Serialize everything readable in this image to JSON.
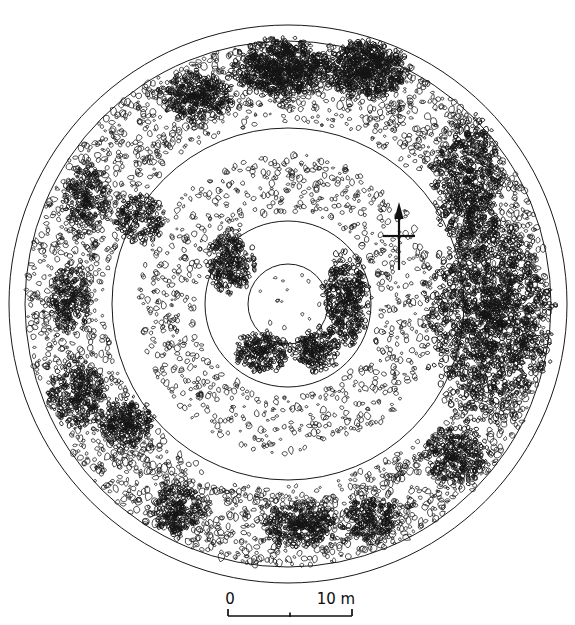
{
  "figure": {
    "kind": "archaeological-site-plan",
    "background_color": "#ffffff",
    "line_color": "#1a1a1a",
    "stone_color": "#141414"
  },
  "canvas": {
    "width": 575,
    "height": 625,
    "center_x": 288,
    "center_y": 304
  },
  "rings": [
    {
      "name": "outer-bank-outer-edge",
      "radius": 279
    },
    {
      "name": "outer-bank-inner-edge",
      "radius": 263
    },
    {
      "name": "middle-ring",
      "radius": 176
    },
    {
      "name": "inner-ring",
      "radius": 83
    },
    {
      "name": "central-circle",
      "radius": 40
    }
  ],
  "scale_bar": {
    "name": "scale-bar",
    "left_label": "0",
    "right_label": "10 m",
    "left_x": 228,
    "right_x": 352,
    "baseline_y": 616,
    "tick_height": 7,
    "mid_tick": true,
    "units": "m",
    "length_value": 10
  },
  "north_arrow": {
    "name": "north-arrow",
    "x": 399,
    "top_y": 202,
    "bottom_y": 270,
    "cross_y": 236,
    "cross_half_width": 16,
    "points": "up"
  },
  "stone_zones": [
    {
      "id": "outer-band-primary",
      "r_min": 196,
      "r_max": 262,
      "count": 2600,
      "size_min": 1.6,
      "size_max": 4.2,
      "seed": 11
    },
    {
      "id": "outer-band-secondary",
      "r_min": 182,
      "r_max": 205,
      "count": 520,
      "size_min": 1.5,
      "size_max": 3.4,
      "seed": 23
    },
    {
      "id": "mid-band",
      "r_min": 92,
      "r_max": 150,
      "count": 900,
      "size_min": 1.5,
      "size_max": 3.6,
      "seed": 37
    },
    {
      "id": "central-sparse",
      "r_min": 6,
      "r_max": 34,
      "count": 14,
      "size_min": 1.3,
      "size_max": 2.4,
      "seed": 53
    }
  ],
  "dense_clusters": [
    {
      "id": "east-massive",
      "cx": 489,
      "cy": 318,
      "rx": 56,
      "ry": 96,
      "count": 1500,
      "size": 2.7,
      "seed": 101
    },
    {
      "id": "east-upper",
      "cx": 470,
      "cy": 185,
      "rx": 34,
      "ry": 60,
      "count": 620,
      "size": 2.5,
      "seed": 107
    },
    {
      "id": "north-main",
      "cx": 281,
      "cy": 68,
      "rx": 44,
      "ry": 27,
      "count": 680,
      "size": 2.6,
      "seed": 113
    },
    {
      "id": "north-east",
      "cx": 366,
      "cy": 70,
      "rx": 40,
      "ry": 26,
      "count": 620,
      "size": 2.6,
      "seed": 127
    },
    {
      "id": "northwest-arc",
      "cx": 196,
      "cy": 96,
      "rx": 34,
      "ry": 22,
      "count": 380,
      "size": 2.3,
      "seed": 131
    },
    {
      "id": "west-lower",
      "cx": 78,
      "cy": 395,
      "rx": 26,
      "ry": 33,
      "count": 300,
      "size": 2.3,
      "seed": 139
    },
    {
      "id": "southwest-patch",
      "cx": 128,
      "cy": 424,
      "rx": 26,
      "ry": 24,
      "count": 270,
      "size": 2.3,
      "seed": 149
    },
    {
      "id": "south-southwest",
      "cx": 178,
      "cy": 510,
      "rx": 25,
      "ry": 24,
      "count": 260,
      "size": 2.3,
      "seed": 151
    },
    {
      "id": "south-main",
      "cx": 300,
      "cy": 525,
      "rx": 34,
      "ry": 22,
      "count": 330,
      "size": 2.4,
      "seed": 157
    },
    {
      "id": "south-east",
      "cx": 370,
      "cy": 520,
      "rx": 28,
      "ry": 21,
      "count": 250,
      "size": 2.3,
      "seed": 163
    },
    {
      "id": "southeast-outer",
      "cx": 455,
      "cy": 455,
      "rx": 30,
      "ry": 28,
      "count": 300,
      "size": 2.3,
      "seed": 167
    },
    {
      "id": "west-upper",
      "cx": 86,
      "cy": 200,
      "rx": 22,
      "ry": 30,
      "count": 240,
      "size": 2.2,
      "seed": 173
    },
    {
      "id": "west-mid",
      "cx": 70,
      "cy": 300,
      "rx": 20,
      "ry": 34,
      "count": 250,
      "size": 2.2,
      "seed": 179
    },
    {
      "id": "inner-west",
      "cx": 230,
      "cy": 262,
      "rx": 22,
      "ry": 30,
      "count": 300,
      "size": 2.3,
      "seed": 181
    },
    {
      "id": "inner-east",
      "cx": 346,
      "cy": 300,
      "rx": 22,
      "ry": 44,
      "count": 420,
      "size": 2.4,
      "seed": 191
    },
    {
      "id": "inner-south",
      "cx": 262,
      "cy": 352,
      "rx": 26,
      "ry": 20,
      "count": 260,
      "size": 2.3,
      "seed": 193
    },
    {
      "id": "inner-southeast",
      "cx": 318,
      "cy": 350,
      "rx": 22,
      "ry": 20,
      "count": 220,
      "size": 2.3,
      "seed": 197
    }
  ],
  "discrete_features": [
    {
      "id": "round-cairn-west",
      "name": "round-stone-feature",
      "cx": 140,
      "cy": 219,
      "r": 25,
      "count": 210,
      "size": 2.4,
      "seed": 211
    }
  ]
}
